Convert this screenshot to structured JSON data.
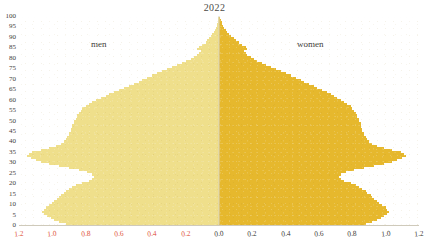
{
  "title": "2022",
  "labels": {
    "men": "men",
    "women": "women"
  },
  "colors": {
    "men_fill": "#efdf8b",
    "women_fill": "#e6b82d",
    "men_tick_text": "#e0553d",
    "women_tick_text": "#3f3d39",
    "axis_line": "#d8d3c4",
    "background": "#ffffff"
  },
  "chart_data": {
    "type": "bar",
    "subtype": "population-pyramid",
    "title": "2022",
    "xlabel": "",
    "ylabel": "",
    "orientation": "horizontal",
    "grid": false,
    "legend_position": "in-plot",
    "xlim": [
      -1.2,
      1.2
    ],
    "ylim": [
      0,
      100
    ],
    "x_tick_labels_left": [
      "1.2",
      "1.0",
      "0.8",
      "0.6",
      "0.4",
      "0.2"
    ],
    "x_tick_labels_right": [
      "0.0",
      "0.2",
      "0.4",
      "0.6",
      "0.8",
      "1.0",
      "1.2"
    ],
    "x_ticks": [
      -1.2,
      -1.0,
      -0.8,
      -0.6,
      -0.4,
      -0.2,
      0.0,
      0.2,
      0.4,
      0.6,
      0.8,
      1.0,
      1.2
    ],
    "y_tick_labels": [
      "0",
      "5",
      "10",
      "15",
      "20",
      "25",
      "30",
      "35",
      "40",
      "45",
      "50",
      "55",
      "60",
      "65",
      "70",
      "75",
      "80",
      "85",
      "90",
      "95",
      "100"
    ],
    "y_ticks": [
      0,
      5,
      10,
      15,
      20,
      25,
      30,
      35,
      40,
      45,
      50,
      55,
      60,
      65,
      70,
      75,
      80,
      85,
      90,
      95,
      100
    ],
    "ages": [
      0,
      1,
      2,
      3,
      4,
      5,
      6,
      7,
      8,
      9,
      10,
      11,
      12,
      13,
      14,
      15,
      16,
      17,
      18,
      19,
      20,
      21,
      22,
      23,
      24,
      25,
      26,
      27,
      28,
      29,
      30,
      31,
      32,
      33,
      34,
      35,
      36,
      37,
      38,
      39,
      40,
      41,
      42,
      43,
      44,
      45,
      46,
      47,
      48,
      49,
      50,
      51,
      52,
      53,
      54,
      55,
      56,
      57,
      58,
      59,
      60,
      61,
      62,
      63,
      64,
      65,
      66,
      67,
      68,
      69,
      70,
      71,
      72,
      73,
      74,
      75,
      76,
      77,
      78,
      79,
      80,
      81,
      82,
      83,
      84,
      85,
      86,
      87,
      88,
      89,
      90,
      91,
      92,
      93,
      94,
      95,
      96,
      97,
      98,
      99,
      100
    ],
    "series": [
      {
        "name": "men",
        "side": "left",
        "values": [
          0.92,
          0.96,
          0.99,
          1.01,
          1.03,
          1.05,
          1.06,
          1.05,
          1.04,
          1.02,
          1.0,
          0.99,
          0.97,
          0.96,
          0.95,
          0.93,
          0.92,
          0.9,
          0.88,
          0.86,
          0.82,
          0.78,
          0.76,
          0.75,
          0.76,
          0.79,
          0.84,
          0.9,
          0.96,
          1.02,
          1.07,
          1.1,
          1.13,
          1.15,
          1.14,
          1.12,
          1.07,
          1.02,
          0.98,
          0.95,
          0.93,
          0.92,
          0.91,
          0.9,
          0.9,
          0.89,
          0.89,
          0.88,
          0.88,
          0.87,
          0.87,
          0.86,
          0.85,
          0.85,
          0.84,
          0.83,
          0.82,
          0.8,
          0.78,
          0.76,
          0.74,
          0.71,
          0.68,
          0.66,
          0.63,
          0.6,
          0.57,
          0.54,
          0.51,
          0.48,
          0.46,
          0.43,
          0.4,
          0.37,
          0.34,
          0.31,
          0.28,
          0.25,
          0.22,
          0.2,
          0.17,
          0.15,
          0.13,
          0.12,
          0.11,
          0.13,
          0.12,
          0.1,
          0.08,
          0.07,
          0.06,
          0.05,
          0.04,
          0.03,
          0.025,
          0.02,
          0.015,
          0.012,
          0.009,
          0.006,
          0.004
        ]
      },
      {
        "name": "women",
        "side": "right",
        "values": [
          0.88,
          0.92,
          0.95,
          0.97,
          0.99,
          1.01,
          1.02,
          1.01,
          1.0,
          0.98,
          0.96,
          0.95,
          0.93,
          0.92,
          0.91,
          0.89,
          0.88,
          0.86,
          0.84,
          0.82,
          0.79,
          0.75,
          0.73,
          0.72,
          0.73,
          0.76,
          0.81,
          0.87,
          0.93,
          0.99,
          1.04,
          1.07,
          1.1,
          1.12,
          1.11,
          1.09,
          1.04,
          0.99,
          0.95,
          0.92,
          0.9,
          0.89,
          0.88,
          0.87,
          0.87,
          0.86,
          0.86,
          0.85,
          0.85,
          0.85,
          0.84,
          0.84,
          0.83,
          0.83,
          0.82,
          0.81,
          0.8,
          0.79,
          0.77,
          0.75,
          0.73,
          0.71,
          0.69,
          0.67,
          0.65,
          0.62,
          0.59,
          0.57,
          0.54,
          0.51,
          0.49,
          0.46,
          0.43,
          0.4,
          0.37,
          0.34,
          0.31,
          0.28,
          0.26,
          0.23,
          0.21,
          0.19,
          0.17,
          0.16,
          0.15,
          0.17,
          0.16,
          0.14,
          0.12,
          0.1,
          0.09,
          0.07,
          0.06,
          0.05,
          0.04,
          0.03,
          0.025,
          0.02,
          0.015,
          0.01,
          0.006
        ]
      }
    ]
  }
}
